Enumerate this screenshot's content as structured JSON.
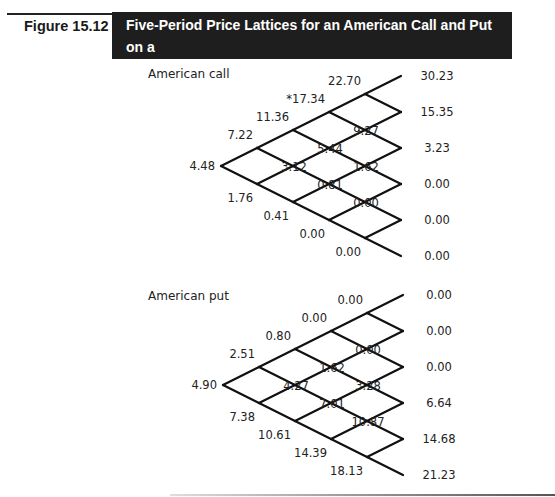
{
  "figure": {
    "label": "Figure 15.12",
    "title_line1": "Five-Period Price Lattices for an American Call and Put on a",
    "title_line2": "Stock with a Known Dollar Dividend"
  },
  "call": {
    "label": "American call",
    "nodes": [
      [
        "4.48"
      ],
      [
        "7.22",
        "1.76"
      ],
      [
        "11.36",
        "3.12",
        "0.41"
      ],
      [
        "*17.34",
        "5.44",
        "0.81",
        "0.00"
      ],
      [
        "22.70",
        "9.27",
        "1.62",
        "0.00",
        "0.00"
      ],
      [
        "30.23",
        "15.35",
        "3.23",
        "0.00",
        "0.00",
        "0.00"
      ]
    ]
  },
  "put": {
    "label": "American put",
    "nodes": [
      [
        "4.90"
      ],
      [
        "2.51",
        "7.38"
      ],
      [
        "0.80",
        "4.27",
        "10.61"
      ],
      [
        "0.00",
        "1.62",
        "7.01",
        "14.39"
      ],
      [
        "0.00",
        "0.00",
        "3.28",
        "10.87",
        "18.13"
      ],
      [
        "0.00",
        "0.00",
        "0.00",
        "6.64",
        "14.68",
        "21.23"
      ]
    ]
  },
  "colors": {
    "title_bg": "#1e1e1e",
    "title_text": "#ffffff",
    "line": "#111111"
  }
}
